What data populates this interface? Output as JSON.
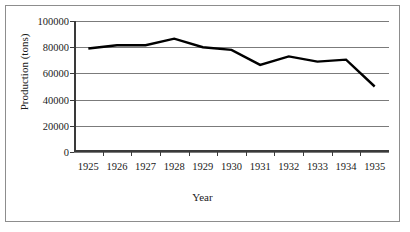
{
  "chart_data": {
    "type": "line",
    "title": "",
    "xlabel": "Year",
    "ylabel": "Production (tons)",
    "categories": [
      "1925",
      "1926",
      "1927",
      "1928",
      "1929",
      "1930",
      "1931",
      "1932",
      "1933",
      "1934",
      "1935"
    ],
    "values": [
      79000,
      81500,
      81500,
      86500,
      80000,
      78000,
      66500,
      73000,
      69000,
      70500,
      50000
    ],
    "series": [
      {
        "name": "Production",
        "values": [
          79000,
          81500,
          81500,
          86500,
          80000,
          78000,
          66500,
          73000,
          69000,
          70500,
          50000
        ]
      }
    ],
    "ylim": [
      0,
      100000
    ],
    "ytick_values": [
      0,
      20000,
      40000,
      60000,
      80000,
      100000
    ],
    "ytick_labels": [
      "0",
      "20000",
      "40000",
      "60000",
      "80000",
      "100000"
    ],
    "grid": true,
    "legend": false,
    "legend_position": "none",
    "line_color": "#000000",
    "grid_color": "#7b7b7b",
    "axis_color": "#3a3a3a",
    "border_color": "#8d8d8d",
    "background": "#ffffff"
  }
}
